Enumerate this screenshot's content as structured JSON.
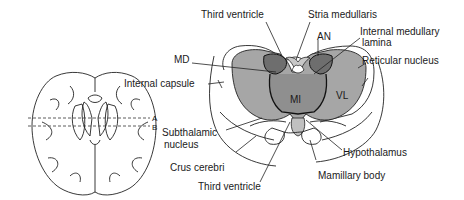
{
  "locator": {
    "cut_labels": [
      "A",
      "B"
    ]
  },
  "labels": {
    "third_ventricle_top": "Third ventricle",
    "stria_medullaris": "Stria medullaris",
    "an": "AN",
    "internal_medullary_lamina_1": "Internal medullary",
    "internal_medullary_lamina_2": "lamina",
    "md": "MD",
    "reticular_nucleus": "Reticular nucleus",
    "internal_capsule": "Internal capsule",
    "mi": "MI",
    "vl": "VL",
    "subthalamic_nucleus_1": "Subthalamic",
    "subthalamic_nucleus_2": "nucleus",
    "hypothalamus": "Hypothalamus",
    "crus_cerebri": "Crus cerebri",
    "mamillary_body": "Mamillary body",
    "third_ventricle_bottom": "Third ventricle"
  },
  "colors": {
    "thalamus_fill": "#a6a6a6",
    "nucleus_dark": "#6e6e6e",
    "midline_fill": "#c8c8c8",
    "mi_fill": "#8f8f8f"
  }
}
